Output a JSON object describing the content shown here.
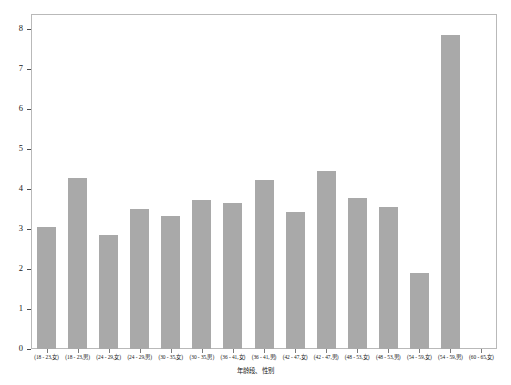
{
  "chart_data": {
    "type": "bar",
    "title": "",
    "subtitle": "",
    "xlabel": "年龄段、性别",
    "ylabel": "",
    "grid": false,
    "legend": null,
    "ylim": [
      0,
      8
    ],
    "yticks": [
      0,
      1,
      2,
      3,
      4,
      5,
      6,
      7,
      8
    ],
    "ytick_labels": [
      "0",
      "1",
      "2",
      "3",
      "4",
      "5",
      "6",
      "7",
      "8"
    ],
    "categories": [
      "(18 - 23,女)",
      "(18 - 23,男)",
      "(24 - 29,女)",
      "(24 - 29,男)",
      "(30 - 35,女)",
      "(30 - 35,男)",
      "(36 - 41,女)",
      "(36 - 41,男)",
      "(42 - 47,女)",
      "(42 - 47,男)",
      "(48 - 53,女)",
      "(48 - 53,男)",
      "(54 - 59,女)",
      "(54 - 59,男)",
      "(60 - 65,女)"
    ],
    "values": [
      3.05,
      4.27,
      2.85,
      3.5,
      3.32,
      3.72,
      3.65,
      4.22,
      3.43,
      4.45,
      3.78,
      3.55,
      1.9,
      7.85,
      0
    ],
    "bar_color": "#a9a9a9",
    "axis_color": "#b9b9b9",
    "background_color": "#ffffff"
  }
}
